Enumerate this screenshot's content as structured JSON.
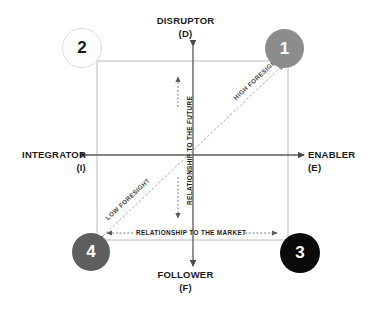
{
  "diagram": {
    "title_poles": {
      "top": {
        "name": "DISRUPTOR",
        "code": "(D)"
      },
      "bottom": {
        "name": "FOLLOWER",
        "code": "(F)"
      },
      "left": {
        "name": "INTEGRATOR",
        "code": "(I)"
      },
      "right": {
        "name": "ENABLER",
        "code": "(E)"
      }
    },
    "internal_axis_labels": {
      "vertical": "RELATIONSHIP TO THE FUTURE",
      "horizontal": "RELATIONSHIP TO THE MARKET"
    },
    "diagonal_labels": {
      "upper_right": "HIGH FORESIGHT",
      "lower_left": "LOW FORESIGHT"
    },
    "quadrant_nodes": [
      {
        "label": "1",
        "position": "top-right",
        "fill": "#8c8c8c",
        "text_color": "#ffffff",
        "border": "none"
      },
      {
        "label": "2",
        "position": "top-left",
        "fill": "#fdfdfd",
        "text_color": "#1a1a1a",
        "border": "#d8d8d8"
      },
      {
        "label": "3",
        "position": "bottom-right",
        "fill": "#0a0a0a",
        "text_color": "#ffffff",
        "border": "none"
      },
      {
        "label": "4",
        "position": "bottom-left",
        "fill": "#5e5e5e",
        "text_color": "#ffffff",
        "border": "none"
      }
    ],
    "colors": {
      "axis_line": "#5a5a5a",
      "square_outline": "#b9b9b9",
      "diagonal_line": "#a8a8a8",
      "dotted_guide": "#6e6e6e",
      "text": "#1a1a1a"
    }
  }
}
